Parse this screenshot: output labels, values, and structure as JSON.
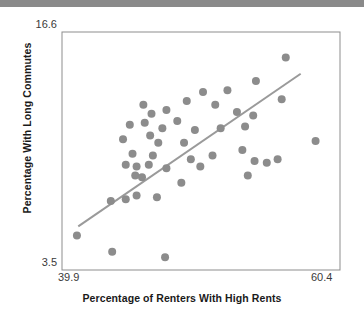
{
  "figure": {
    "top_bar_color": "#8a8a8a",
    "background_color": "#ffffff",
    "frame_color": "#8d8d8d",
    "point_color": "#8c8c8c",
    "line_color": "#9a9a9a",
    "tick_color": "#3a3a3a",
    "label_color": "#1a1a1a"
  },
  "chart_data": {
    "type": "scatter",
    "title": "",
    "xlabel": "Percentage of Renters With High Rents",
    "ylabel": "Percentage With Long Commutes",
    "xlim": [
      39.9,
      60.4
    ],
    "ylim": [
      3.5,
      16.6
    ],
    "xticks": [
      39.9,
      60.4
    ],
    "yticks": [
      3.5,
      16.6
    ],
    "xtick_labels": [
      "39.9",
      "60.4"
    ],
    "ytick_labels": [
      "3.5",
      "16.6"
    ],
    "grid": false,
    "legend": false,
    "marker": "circle",
    "marker_size": 8,
    "points": [
      {
        "x": 41.0,
        "y": 5.4
      },
      {
        "x": 43.6,
        "y": 4.5
      },
      {
        "x": 47.5,
        "y": 4.2
      },
      {
        "x": 43.5,
        "y": 7.3
      },
      {
        "x": 44.6,
        "y": 7.4
      },
      {
        "x": 45.4,
        "y": 7.6
      },
      {
        "x": 46.9,
        "y": 7.5
      },
      {
        "x": 45.3,
        "y": 8.7
      },
      {
        "x": 45.8,
        "y": 8.6
      },
      {
        "x": 44.6,
        "y": 9.3
      },
      {
        "x": 45.4,
        "y": 9.2
      },
      {
        "x": 46.3,
        "y": 9.3
      },
      {
        "x": 45.1,
        "y": 9.9
      },
      {
        "x": 46.6,
        "y": 9.8
      },
      {
        "x": 47.6,
        "y": 9.1
      },
      {
        "x": 48.7,
        "y": 8.3
      },
      {
        "x": 47.0,
        "y": 10.5
      },
      {
        "x": 46.4,
        "y": 10.9
      },
      {
        "x": 47.3,
        "y": 11.3
      },
      {
        "x": 44.4,
        "y": 10.7
      },
      {
        "x": 44.9,
        "y": 11.5
      },
      {
        "x": 46.0,
        "y": 11.6
      },
      {
        "x": 46.5,
        "y": 12.1
      },
      {
        "x": 45.9,
        "y": 12.6
      },
      {
        "x": 47.6,
        "y": 12.3
      },
      {
        "x": 48.4,
        "y": 11.7
      },
      {
        "x": 48.9,
        "y": 10.5
      },
      {
        "x": 49.7,
        "y": 11.2
      },
      {
        "x": 49.1,
        "y": 12.8
      },
      {
        "x": 50.3,
        "y": 13.3
      },
      {
        "x": 51.2,
        "y": 12.6
      },
      {
        "x": 52.1,
        "y": 13.4
      },
      {
        "x": 52.8,
        "y": 12.2
      },
      {
        "x": 51.6,
        "y": 11.3
      },
      {
        "x": 53.4,
        "y": 11.4
      },
      {
        "x": 54.2,
        "y": 13.9
      },
      {
        "x": 54.0,
        "y": 12.0
      },
      {
        "x": 53.2,
        "y": 10.1
      },
      {
        "x": 54.1,
        "y": 9.5
      },
      {
        "x": 55.0,
        "y": 9.4
      },
      {
        "x": 55.8,
        "y": 9.6
      },
      {
        "x": 56.4,
        "y": 15.2
      },
      {
        "x": 56.1,
        "y": 12.9
      },
      {
        "x": 53.6,
        "y": 8.7
      },
      {
        "x": 58.6,
        "y": 10.6
      },
      {
        "x": 51.0,
        "y": 9.8
      },
      {
        "x": 50.1,
        "y": 9.2
      },
      {
        "x": 49.4,
        "y": 9.6
      }
    ],
    "trendline": {
      "visible": true,
      "x_start": 41.1,
      "y_start": 5.9,
      "x_end": 57.5,
      "y_end": 14.3
    }
  }
}
